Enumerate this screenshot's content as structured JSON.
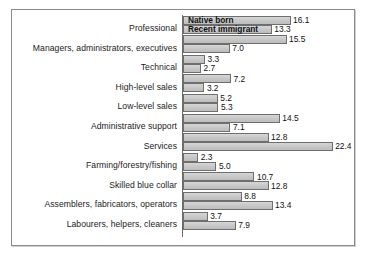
{
  "chart_data": {
    "type": "bar",
    "orientation": "horizontal",
    "title": "",
    "subtitle": "",
    "xlabel": "",
    "ylabel": "",
    "grid": false,
    "legend_position": "inside-first-bars",
    "xlim": [
      0,
      22.4
    ],
    "categories": [
      "Professional",
      "Managers, administrators, executives",
      "Technical",
      "High-level sales",
      "Low-level sales",
      "Administrative support",
      "Services",
      "Farming/forestry/fishing",
      "Skilled blue collar",
      "Assemblers, fabricators, operators",
      "Labourers, helpers, cleaners"
    ],
    "series": [
      {
        "name": "Native born",
        "values": [
          16.1,
          15.5,
          3.3,
          7.2,
          5.2,
          14.5,
          12.8,
          2.3,
          10.7,
          8.8,
          3.7
        ]
      },
      {
        "name": "Recent immigrant",
        "values": [
          13.3,
          7.0,
          2.7,
          3.2,
          5.3,
          7.1,
          22.4,
          5.0,
          12.8,
          13.4,
          7.9
        ]
      }
    ],
    "value_labels": [
      "16.1",
      "13.3",
      "15.5",
      "7.0",
      "3.3",
      "2.7",
      "7.2",
      "3.2",
      "5.2",
      "5.3",
      "14.5",
      "7.1",
      "12.8",
      "22.4",
      "2.3",
      "5.0",
      "10.7",
      "12.8",
      "8.8",
      "13.4",
      "3.7",
      "7.9"
    ],
    "colors": {
      "bar_fill": "#c7c7c7",
      "bar_stroke": "#6e6e6e",
      "axis": "#6b6b6b",
      "frame": "#8a8a8a",
      "text": "#1b1b1b",
      "background": "#ffffff"
    }
  },
  "legend": {
    "entries": [
      {
        "label": "Native born"
      },
      {
        "label": "Recent immigrant"
      }
    ]
  }
}
